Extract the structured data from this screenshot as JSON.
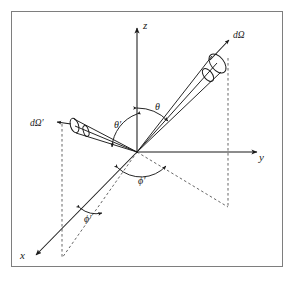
{
  "figure": {
    "type": "scattering-geometry-diagram",
    "background_color": "#ffffff",
    "frame_color": "#7e7e7e",
    "line_color": "#1a1a1a",
    "dashed_color": "#555555"
  },
  "axes": [
    {
      "name": "z",
      "label": "z",
      "direction": "up"
    },
    {
      "name": "y",
      "label": "y",
      "direction": "right"
    },
    {
      "name": "x",
      "label": "x",
      "direction": "down-left"
    }
  ],
  "solid_angles": [
    {
      "name": "outgoing",
      "label": "dΩ",
      "position": "upper-right"
    },
    {
      "name": "incoming",
      "label": "dΩ′",
      "position": "left"
    }
  ],
  "angles": [
    {
      "name": "theta",
      "label": "θ",
      "kind": "polar",
      "measured_from": "z-axis",
      "toward": "dΩ"
    },
    {
      "name": "theta-prime",
      "label": "θ′",
      "kind": "polar",
      "measured_from": "z-axis",
      "toward": "dΩ′"
    },
    {
      "name": "phi",
      "label": "ϕ′",
      "kind": "azimuthal",
      "position": "near-origin"
    },
    {
      "name": "phi-prime",
      "label": "ϕ′",
      "kind": "azimuthal",
      "position": "lower-left"
    }
  ],
  "origin": {
    "x": 137,
    "y": 152
  }
}
